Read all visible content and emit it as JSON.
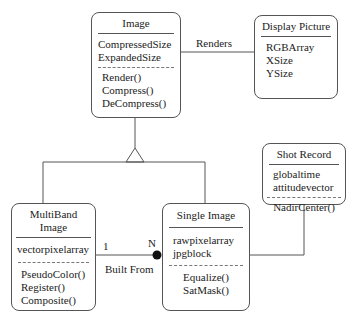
{
  "classes": {
    "image": {
      "name": "Image",
      "attributes": [
        "CompressedSize",
        "ExpandedSize"
      ],
      "operations": [
        "Render()",
        "Compress()",
        "DeCompress()"
      ]
    },
    "display_picture": {
      "name": "Display Picture",
      "attributes": [
        "RGBArray",
        "XSize",
        "YSize"
      ],
      "operations": []
    },
    "shot_record": {
      "name": "Shot Record",
      "attributes": [
        "globaltime",
        "attitudevector"
      ],
      "operations": [
        "NadirCenter()"
      ]
    },
    "multiband_image": {
      "name": "MultiBand Image",
      "attributes": [
        "vectorpixelarray"
      ],
      "operations": [
        "PseudoColor()",
        "Register()",
        "Composite()"
      ]
    },
    "single_image": {
      "name": "Single Image",
      "attributes": [
        "rawpixelarray",
        "jpgblock"
      ],
      "operations": [
        "Equalize()",
        "SatMask()"
      ]
    }
  },
  "relationships": {
    "renders": {
      "label": "Renders",
      "from": "Image",
      "to": "Display Picture"
    },
    "built_from": {
      "label": "Built From",
      "from": "MultiBand Image",
      "to": "Single Image",
      "multiplicity_from": "1",
      "multiplicity_to": "N",
      "type": "aggregation"
    },
    "generalization": {
      "parent": "Image",
      "children": [
        "MultiBand Image",
        "Single Image"
      ]
    },
    "shot_link": {
      "from": "Shot Record",
      "to": "Single Image"
    }
  },
  "colors": {
    "line": "#555555",
    "text": "#222222",
    "background": "#ffffff"
  }
}
